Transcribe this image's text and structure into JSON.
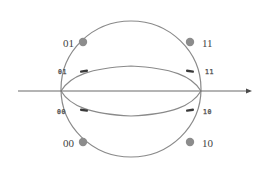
{
  "diagram": {
    "type": "state-sphere",
    "colors": {
      "background": "#ffffff",
      "curve": "#8a8a8a",
      "axis": "#6a6a6a",
      "outer_dot": "#8c8c8c",
      "inner_marker": "#3a3a3a",
      "label": "#444444"
    },
    "axis": {
      "label": "",
      "direction": "right"
    },
    "outer_states": [
      {
        "id": "01",
        "label": "01",
        "position": "upper-left"
      },
      {
        "id": "11",
        "label": "11",
        "position": "upper-right"
      },
      {
        "id": "00",
        "label": "00",
        "position": "lower-left"
      },
      {
        "id": "10",
        "label": "10",
        "position": "lower-right"
      }
    ],
    "inner_states": [
      {
        "id": "01",
        "label": "01",
        "position": "upper-left"
      },
      {
        "id": "11",
        "label": "11",
        "position": "upper-right"
      },
      {
        "id": "00",
        "label": "00",
        "position": "lower-left"
      },
      {
        "id": "10",
        "label": "10",
        "position": "lower-right"
      }
    ]
  }
}
